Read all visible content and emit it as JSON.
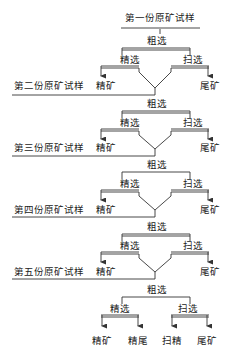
{
  "diagram": {
    "type": "mineral-processing-flowsheet",
    "title": "第一份原矿试样",
    "stages": {
      "rougher": "粗选",
      "cleaner": "精选",
      "scavenger": "扫选"
    },
    "products": {
      "concentrate": "精矿",
      "tailings": "尾矿",
      "cleaner_tailings": "精尾",
      "scavenger_concentrate": "扫精"
    },
    "samples": [
      "第一份原矿试样",
      "第二份原矿试样",
      "第三份原矿试样",
      "第四份原矿试样",
      "第五份原矿试样"
    ],
    "blocks": [
      {
        "rougher": "粗选",
        "cleaner": "精选",
        "scavenger": "扫选",
        "left_product": "精矿",
        "right_product": "尾矿",
        "next_sample": "第二份原矿试样"
      },
      {
        "rougher": "粗选",
        "cleaner": "精选",
        "scavenger": "扫选",
        "left_product": "精矿",
        "right_product": "尾矿",
        "next_sample": "第三份原矿试样"
      },
      {
        "rougher": "粗选",
        "cleaner": "精选",
        "scavenger": "扫选",
        "left_product": "精矿",
        "right_product": "尾矿",
        "next_sample": "第四份原矿试样"
      },
      {
        "rougher": "粗选",
        "cleaner": "精选",
        "scavenger": "扫选",
        "left_product": "精矿",
        "right_product": "尾矿",
        "next_sample": "第五份原矿试样"
      },
      {
        "rougher": "粗选",
        "cleaner": "精选",
        "scavenger": "扫选",
        "final_products": [
          "精矿",
          "精尾",
          "扫精",
          "尾矿"
        ]
      }
    ],
    "line_color": "#333333",
    "text_color": "#222222"
  }
}
